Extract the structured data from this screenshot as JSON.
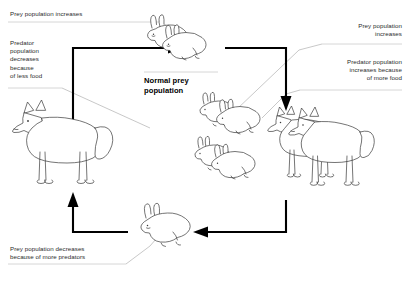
{
  "diagram": {
    "center_label": "Normal prey\npopulation",
    "labels": {
      "top_left": "Prey population increases",
      "mid_left": "Predator\npopulation\ndecreases\nbecause\nof less food",
      "top_right": "Prey population\nincreases",
      "mid_right": "Predator population\nincreases because\nof more food",
      "bottom_left": "Prey population decreases\nbecause of more predators"
    },
    "stages": [
      {
        "name": "normal-prey-population",
        "animal": "rabbit",
        "count": 2,
        "position": "top-center"
      },
      {
        "name": "increased-prey-population",
        "animal": "rabbit",
        "count": 4,
        "position": "middle-right"
      },
      {
        "name": "increased-predator-population",
        "animal": "fox",
        "count": 2,
        "position": "right"
      },
      {
        "name": "decreased-prey-population",
        "animal": "rabbit",
        "count": 1,
        "position": "bottom-center"
      },
      {
        "name": "decreased-predator-population",
        "animal": "fox",
        "count": 1,
        "position": "left"
      }
    ],
    "arrows": [
      {
        "name": "arrow-left-up-to-normal-prey",
        "direction": "up-right"
      },
      {
        "name": "arrow-normal-prey-to-increase",
        "direction": "right-down"
      },
      {
        "name": "arrow-right-to-bottom-prey",
        "direction": "left"
      },
      {
        "name": "arrow-bottom-prey-to-left",
        "direction": "left-up"
      }
    ],
    "colors": {
      "ink": "#3a3a3a",
      "arrow": "#000000",
      "label_text": "#2b2b2b",
      "leader": "#9a9a9a",
      "background": "#ffffff"
    }
  }
}
